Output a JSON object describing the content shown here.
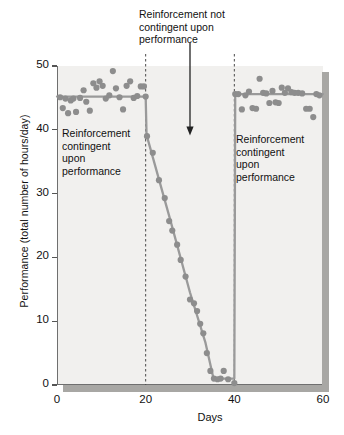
{
  "chart_data": {
    "type": "scatter",
    "title": "",
    "xlabel": "Days",
    "ylabel": "Performance (total number of hours/day)",
    "xlim": [
      0,
      60
    ],
    "ylim": [
      0,
      50
    ],
    "xticks": [
      0,
      20,
      40,
      60
    ],
    "yticks": [
      0,
      10,
      20,
      30,
      40,
      50
    ],
    "grid": false,
    "legend": null,
    "point_color": "#8d8d8d",
    "line_color": "#9a9a9a",
    "plot_background": "#f1f0ee",
    "axis_color": "#6f6f6f",
    "phase_dividers": [
      20,
      40
    ],
    "annotations": [
      {
        "name": "reinforcement-not-contingent",
        "text": "Reinforcement not\ncontingent upon\nperformance",
        "arrow_from_x": 30,
        "arrow_from_y": 50,
        "arrow_to_y": 40.5
      },
      {
        "name": "reinforcement-contingent-left",
        "text": "Reinforcement\ncontingent\nupon\nperformance"
      },
      {
        "name": "reinforcement-contingent-right",
        "text": "Reinforcement\ncontingent\nupon\nperformance"
      }
    ],
    "series": [
      {
        "name": "Observed performance",
        "type": "scatter",
        "points": [
          [
            0.7,
            45.1
          ],
          [
            1.3,
            43.4
          ],
          [
            1.9,
            44.9
          ],
          [
            2.5,
            42.6
          ],
          [
            3.1,
            44.6
          ],
          [
            3.7,
            44.9
          ],
          [
            4.3,
            42.8
          ],
          [
            5.2,
            45.0
          ],
          [
            6.0,
            46.2
          ],
          [
            6.6,
            44.4
          ],
          [
            7.4,
            43.0
          ],
          [
            8.2,
            47.3
          ],
          [
            8.9,
            46.6
          ],
          [
            9.6,
            47.6
          ],
          [
            10.3,
            46.9
          ],
          [
            11.0,
            44.9
          ],
          [
            11.8,
            45.4
          ],
          [
            12.6,
            49.2
          ],
          [
            13.3,
            46.5
          ],
          [
            14.1,
            45.1
          ],
          [
            14.9,
            43.2
          ],
          [
            15.7,
            46.9
          ],
          [
            16.5,
            47.6
          ],
          [
            17.3,
            45.0
          ],
          [
            18.1,
            45.3
          ],
          [
            18.9,
            46.8
          ],
          [
            19.6,
            46.8
          ],
          [
            20.0,
            45.2
          ],
          [
            20.3,
            39.0
          ],
          [
            21.6,
            36.4
          ],
          [
            23.0,
            32.1
          ],
          [
            24.3,
            29.3
          ],
          [
            25.3,
            25.7
          ],
          [
            26.0,
            24.2
          ],
          [
            27.1,
            22.0
          ],
          [
            27.9,
            19.6
          ],
          [
            29.0,
            17.0
          ],
          [
            30.0,
            13.4
          ],
          [
            30.9,
            12.8
          ],
          [
            31.6,
            11.6
          ],
          [
            32.3,
            9.6
          ],
          [
            33.0,
            8.1
          ],
          [
            33.8,
            5.0
          ],
          [
            34.6,
            2.2
          ],
          [
            35.4,
            1.0
          ],
          [
            36.2,
            0.9
          ],
          [
            36.9,
            1.0
          ],
          [
            37.6,
            2.2
          ],
          [
            38.6,
            0.9
          ],
          [
            40.0,
            0.3
          ],
          [
            40.2,
            45.6
          ],
          [
            40.9,
            45.6
          ],
          [
            41.7,
            43.2
          ],
          [
            42.5,
            45.4
          ],
          [
            43.3,
            46.0
          ],
          [
            44.1,
            43.4
          ],
          [
            44.9,
            43.3
          ],
          [
            45.7,
            48.0
          ],
          [
            46.5,
            45.8
          ],
          [
            47.2,
            45.7
          ],
          [
            47.9,
            44.2
          ],
          [
            48.6,
            46.1
          ],
          [
            49.3,
            44.3
          ],
          [
            50.0,
            44.2
          ],
          [
            50.7,
            46.6
          ],
          [
            51.4,
            45.8
          ],
          [
            52.1,
            46.5
          ],
          [
            52.9,
            45.9
          ],
          [
            53.6,
            45.8
          ],
          [
            54.4,
            45.8
          ],
          [
            55.3,
            45.7
          ],
          [
            56.2,
            43.3
          ],
          [
            57.0,
            43.3
          ],
          [
            57.8,
            42.0
          ],
          [
            58.5,
            45.6
          ],
          [
            59.2,
            45.4
          ]
        ]
      },
      {
        "name": "Fitted trend",
        "type": "line",
        "points": [
          [
            0.0,
            45.2
          ],
          [
            20.0,
            45.2
          ],
          [
            20.2,
            39.2
          ],
          [
            25.5,
            26.0
          ],
          [
            30.0,
            14.5
          ],
          [
            33.5,
            6.6
          ],
          [
            35.3,
            1.0
          ],
          [
            40.0,
            1.0
          ],
          [
            40.2,
            45.6
          ],
          [
            60.0,
            45.6
          ]
        ]
      }
    ]
  }
}
